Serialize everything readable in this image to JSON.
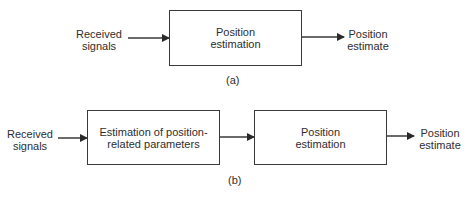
{
  "diagram_a": {
    "input_label": "Received\nsignals",
    "box_label": "Position\nestimation",
    "output_label": "Position\nestimate",
    "caption": "(a)"
  },
  "diagram_b": {
    "input_label": "Received\nsignals",
    "box1_label": "Estimation of position-\nrelated parameters",
    "box2_label": "Position\nestimation",
    "output_label": "Position\nestimate",
    "caption": "(b)"
  },
  "colors": {
    "stroke": "#3a3a3a",
    "text": "#2e2e2e",
    "background": "#ffffff"
  }
}
